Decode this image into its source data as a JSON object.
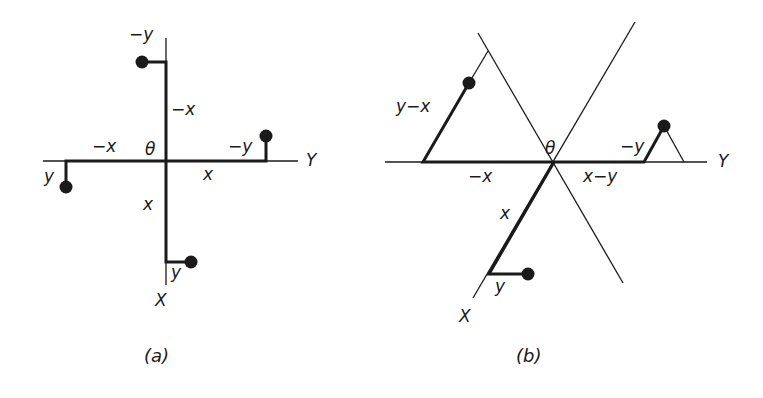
{
  "figure": {
    "panel_a": {
      "caption": "(a)",
      "origin_label": "θ",
      "axis_labels": {
        "horizontal": "Y",
        "vertical": "X"
      },
      "segment_labels": {
        "up_x": "−x",
        "up_y": "−y",
        "left_x": "−x",
        "left_y": "y",
        "right_x": "x",
        "right_y": "−y",
        "down_x": "x",
        "down_y": "y"
      }
    },
    "panel_b": {
      "caption": "(b)",
      "origin_label": "θ",
      "axis_labels": {
        "horizontal": "Y",
        "diagonal": "X"
      },
      "segment_labels": {
        "upper_left": "y−x",
        "left_x": "−x",
        "right_x": "x−y",
        "right_y": "−y",
        "down_x": "x",
        "down_y": "y"
      }
    },
    "colors": {
      "ink": "#1a1a1a",
      "background": "#ffffff"
    }
  }
}
